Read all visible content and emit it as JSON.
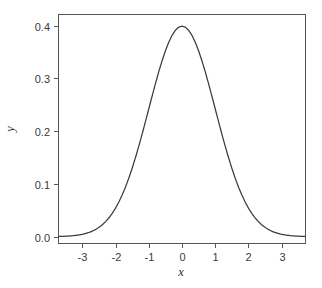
{
  "chart_data": {
    "type": "line",
    "title": "",
    "subtitle": "",
    "xlabel": "x",
    "ylabel": "y",
    "xlim": [
      -3.7,
      3.7
    ],
    "ylim": [
      -0.012,
      0.42
    ],
    "grid": false,
    "legend": null,
    "legend_position": "none",
    "series": [
      {
        "name": "standard normal density",
        "color": "#3b3b3b",
        "x": [
          -3.7,
          -3.6,
          -3.5,
          -3.4,
          -3.3,
          -3.2,
          -3.1,
          -3.0,
          -2.9,
          -2.8,
          -2.7,
          -2.6,
          -2.5,
          -2.4,
          -2.3,
          -2.2,
          -2.1,
          -2.0,
          -1.9,
          -1.8,
          -1.7,
          -1.6,
          -1.5,
          -1.4,
          -1.3,
          -1.2,
          -1.1,
          -1.0,
          -0.9,
          -0.8,
          -0.7,
          -0.6,
          -0.5,
          -0.4,
          -0.3,
          -0.2,
          -0.1,
          0.0,
          0.1,
          0.2,
          0.3,
          0.4,
          0.5,
          0.6,
          0.7,
          0.8,
          0.9,
          1.0,
          1.1,
          1.2,
          1.3,
          1.4,
          1.5,
          1.6,
          1.7,
          1.8,
          1.9,
          2.0,
          2.1,
          2.2,
          2.3,
          2.4,
          2.5,
          2.6,
          2.7,
          2.8,
          2.9,
          3.0,
          3.1,
          3.2,
          3.3,
          3.4,
          3.5,
          3.6,
          3.7
        ],
        "y": [
          0.0004,
          0.0006,
          0.0009,
          0.0012,
          0.0017,
          0.0024,
          0.0033,
          0.0044,
          0.006,
          0.0079,
          0.0104,
          0.0136,
          0.0175,
          0.0224,
          0.0283,
          0.0355,
          0.044,
          0.054,
          0.0656,
          0.079,
          0.094,
          0.1109,
          0.1295,
          0.1497,
          0.1714,
          0.1942,
          0.2179,
          0.242,
          0.2661,
          0.2897,
          0.3123,
          0.3332,
          0.3521,
          0.3683,
          0.3814,
          0.391,
          0.397,
          0.3989,
          0.397,
          0.391,
          0.3814,
          0.3683,
          0.3521,
          0.3332,
          0.3123,
          0.2897,
          0.2661,
          0.242,
          0.2179,
          0.1942,
          0.1714,
          0.1497,
          0.1295,
          0.1109,
          0.094,
          0.079,
          0.0656,
          0.054,
          0.044,
          0.0355,
          0.0283,
          0.0224,
          0.0175,
          0.0136,
          0.0104,
          0.0079,
          0.006,
          0.0044,
          0.0033,
          0.0024,
          0.0017,
          0.0012,
          0.0009,
          0.0006,
          0.0004
        ]
      }
    ],
    "x_ticks": [
      {
        "value": -3,
        "label": "-3"
      },
      {
        "value": -2,
        "label": "-2"
      },
      {
        "value": -1,
        "label": "-1"
      },
      {
        "value": 0,
        "label": "0"
      },
      {
        "value": 1,
        "label": "1"
      },
      {
        "value": 2,
        "label": "2"
      },
      {
        "value": 3,
        "label": "3"
      }
    ],
    "y_ticks": [
      {
        "value": 0.0,
        "label": "0.0"
      },
      {
        "value": 0.1,
        "label": "0.1"
      },
      {
        "value": 0.2,
        "label": "0.2"
      },
      {
        "value": 0.3,
        "label": "0.3"
      },
      {
        "value": 0.4,
        "label": "0.4"
      }
    ],
    "peak": {
      "x": 0,
      "y": 0.3989
    },
    "colors": {
      "curve": "#3b3b3b",
      "frame": "#555555",
      "text": "#2b2b2b",
      "background": "#ffffff"
    }
  }
}
